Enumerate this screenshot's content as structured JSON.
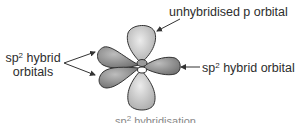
{
  "diagram": {
    "title": "sp2 hybridisation",
    "labels": {
      "p_orbital": "unhybridised p orbital",
      "left_prefix": "sp",
      "left_sup": "2",
      "left_rest_line1": " hybrid",
      "left_line2": "orbitals",
      "right_prefix": "sp",
      "right_sup": "2",
      "right_rest": " hybrid orbital",
      "caption_prefix": "sp",
      "caption_sup": "2",
      "caption_rest": " hybridisation"
    },
    "colors": {
      "p_lobe": "#c8c8c8",
      "sp2_lobe": "#8c8c8c",
      "outline": "#333333",
      "text": "#2d2d2d"
    }
  }
}
